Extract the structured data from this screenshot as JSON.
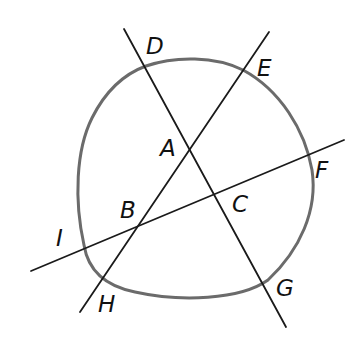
{
  "diagram": {
    "type": "geometry",
    "colors": {
      "curve": "#6b6b6b",
      "lines": "#1a1a1a",
      "labels": "#111111",
      "background": "#ffffff"
    },
    "labels": {
      "A": "A",
      "B": "B",
      "C": "C",
      "D": "D",
      "E": "E",
      "F": "F",
      "G": "G",
      "H": "H",
      "I": "I"
    },
    "lines": [
      {
        "name": "line DG",
        "passes_through": [
          "D",
          "A",
          "C",
          "G"
        ]
      },
      {
        "name": "line EH",
        "passes_through": [
          "E",
          "A",
          "B",
          "H"
        ]
      },
      {
        "name": "line IF",
        "passes_through": [
          "I",
          "B",
          "C",
          "F"
        ]
      }
    ],
    "intersection_points": {
      "A": "intersection of line DG and line EH (inside curve)",
      "B": "intersection of line EH and line IF (inside curve)",
      "C": "intersection of line DG and line IF (inside curve)"
    },
    "curve_points": [
      "D",
      "E",
      "F",
      "G",
      "H",
      "I"
    ]
  }
}
